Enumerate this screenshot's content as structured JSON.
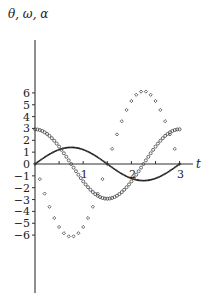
{
  "chart_data": {
    "type": "scatter",
    "title": "",
    "xlabel": "t",
    "ylabel": "θ, ω, α",
    "xlim": [
      0,
      3.2
    ],
    "ylim": [
      -7.5,
      7.1
    ],
    "grid": false,
    "legend": null,
    "x_ticks": [
      0.5,
      1,
      1.5,
      2,
      2.5,
      3
    ],
    "x_tick_labels": [
      {
        "value": 1,
        "label": "1"
      },
      {
        "value": 2,
        "label": "2"
      },
      {
        "value": 3,
        "label": "3"
      }
    ],
    "y_ticks": [
      -6,
      -5,
      -4,
      -3,
      -2,
      -1,
      0,
      1,
      2,
      3,
      4,
      5,
      6
    ],
    "y_tick_labels": [
      "−6",
      "−5",
      "−4",
      "−3",
      "−2",
      "−1",
      "0",
      "1",
      "2",
      "3",
      "4",
      "5",
      "6"
    ],
    "series": [
      {
        "name": "θ",
        "marker": "small-dot",
        "model": "1.4·sin(2.094·t)",
        "x": [
          0,
          0.1,
          0.2,
          0.3,
          0.4,
          0.5,
          0.6,
          0.7,
          0.8,
          0.9,
          1.0,
          1.1,
          1.2,
          1.3,
          1.4,
          1.5,
          1.6,
          1.7,
          1.8,
          1.9,
          2.0,
          2.1,
          2.2,
          2.3,
          2.4,
          2.5,
          2.6,
          2.7,
          2.8,
          2.9,
          3.0
        ],
        "values": [
          0,
          0.29,
          0.57,
          0.82,
          1.04,
          1.21,
          1.33,
          1.39,
          1.39,
          1.33,
          1.21,
          1.04,
          0.82,
          0.57,
          0.29,
          0,
          -0.29,
          -0.57,
          -0.82,
          -1.04,
          -1.21,
          -1.33,
          -1.39,
          -1.39,
          -1.33,
          -1.21,
          -1.04,
          -0.82,
          -0.57,
          -0.29,
          0
        ]
      },
      {
        "name": "ω",
        "marker": "open-circle",
        "model": "2.93·cos(2.094·t)",
        "x": [
          0,
          0.1,
          0.2,
          0.3,
          0.4,
          0.5,
          0.6,
          0.7,
          0.8,
          0.9,
          1.0,
          1.1,
          1.2,
          1.3,
          1.4,
          1.5,
          1.6,
          1.7,
          1.8,
          1.9,
          2.0,
          2.1,
          2.2,
          2.3,
          2.4,
          2.5,
          2.6,
          2.7,
          2.8,
          2.9,
          3.0
        ],
        "values": [
          2.93,
          2.87,
          2.68,
          2.37,
          1.96,
          1.47,
          0.91,
          0.31,
          -0.31,
          -0.91,
          -1.47,
          -1.96,
          -2.37,
          -2.68,
          -2.87,
          -2.93,
          -2.87,
          -2.68,
          -2.37,
          -1.96,
          -1.47,
          -0.91,
          -0.31,
          0.31,
          0.91,
          1.47,
          1.96,
          2.37,
          2.68,
          2.87,
          2.93
        ]
      },
      {
        "name": "α",
        "marker": "diamond",
        "model": "-6.14·sin(2.094·t)",
        "x": [
          0,
          0.1,
          0.2,
          0.3,
          0.4,
          0.5,
          0.6,
          0.7,
          0.8,
          0.9,
          1.0,
          1.1,
          1.2,
          1.3,
          1.4,
          1.5,
          1.6,
          1.7,
          1.8,
          1.9,
          2.0,
          2.1,
          2.2,
          2.3,
          2.4,
          2.5,
          2.6,
          2.7,
          2.8,
          2.9,
          3.0
        ],
        "values": [
          0,
          -1.28,
          -2.5,
          -3.61,
          -4.56,
          -5.32,
          -5.84,
          -6.11,
          -6.11,
          -5.84,
          -5.32,
          -4.56,
          -3.61,
          -2.5,
          -1.28,
          0,
          1.28,
          2.5,
          3.61,
          4.56,
          5.32,
          5.84,
          6.11,
          6.11,
          5.84,
          5.32,
          4.56,
          3.61,
          2.5,
          1.28,
          0
        ]
      }
    ]
  },
  "labels": {
    "y_axis_title": "θ, ω, α",
    "x_axis_title": "t"
  }
}
